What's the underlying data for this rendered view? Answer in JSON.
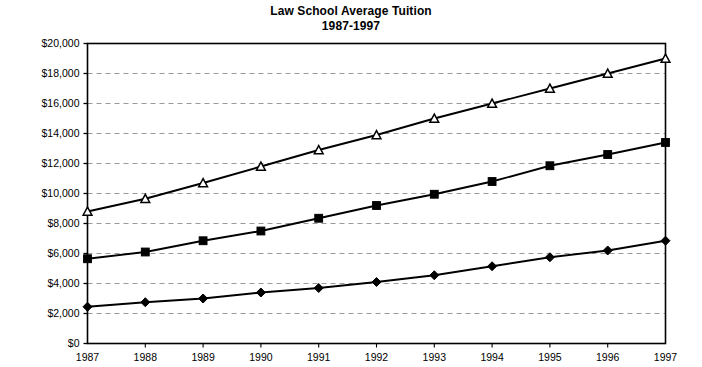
{
  "chart_data": {
    "type": "line",
    "title": "Law School Average Tuition",
    "subtitle": "1987-1997",
    "xlabel": "",
    "ylabel": "",
    "x": [
      1987,
      1988,
      1989,
      1990,
      1991,
      1992,
      1993,
      1994,
      1995,
      1996,
      1997
    ],
    "categories": [
      "1987",
      "1988",
      "1989",
      "1990",
      "1991",
      "1992",
      "1993",
      "1994",
      "1995",
      "1996",
      "1997"
    ],
    "xtick_labels": [
      "1987",
      "1988",
      "1989",
      "1990",
      "1991",
      "1992",
      "1993",
      "1994",
      "1995",
      "1996",
      "1997"
    ],
    "ytick_labels": [
      "$0",
      "$2,000",
      "$4,000",
      "$6,000",
      "$8,000",
      "$10,000",
      "$12,000",
      "$14,000",
      "$16,000",
      "$18,000",
      "$20,000"
    ],
    "ytick_values": [
      0,
      2000,
      4000,
      6000,
      8000,
      10000,
      12000,
      14000,
      16000,
      18000,
      20000
    ],
    "ylim": [
      0,
      20000
    ],
    "xlim": [
      1987,
      1997
    ],
    "grid": "horizontal-dashed",
    "legend": "none",
    "series": [
      {
        "name": "private",
        "marker": "open-triangle",
        "color": "#000000",
        "values": [
          8800,
          9650,
          10700,
          11800,
          12900,
          13900,
          15000,
          16000,
          17000,
          18000,
          19000
        ]
      },
      {
        "name": "public-nonresident",
        "marker": "filled-square",
        "color": "#000000",
        "values": [
          5650,
          6100,
          6850,
          7500,
          8350,
          9200,
          9950,
          10800,
          11850,
          12600,
          13400
        ]
      },
      {
        "name": "public-resident",
        "marker": "filled-diamond",
        "color": "#000000",
        "values": [
          2450,
          2750,
          3000,
          3400,
          3700,
          4100,
          4550,
          5150,
          5750,
          6200,
          6850
        ]
      }
    ]
  }
}
